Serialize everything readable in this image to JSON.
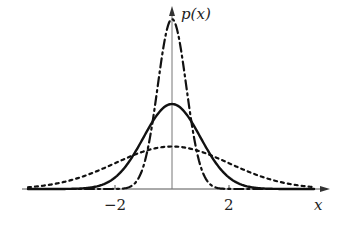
{
  "chart_data": {
    "type": "line",
    "title": "",
    "ylabel": "p(x)",
    "xlabel": "x",
    "x_ticks": [
      -2,
      2
    ],
    "x_tick_labels": [
      "−2",
      "2"
    ],
    "xlim": [
      -5,
      5
    ],
    "ylim": [
      0,
      0.8
    ],
    "grid": false,
    "legend": "none",
    "series": [
      {
        "name": "normal sigma=0.5",
        "style": "dash-dot",
        "mean": 0,
        "sigma": 0.5,
        "peak": 0.798
      },
      {
        "name": "normal sigma=1",
        "style": "solid",
        "mean": 0,
        "sigma": 1,
        "peak": 0.399
      },
      {
        "name": "normal sigma=2",
        "style": "dotted",
        "mean": 0,
        "sigma": 2,
        "peak": 0.199
      }
    ]
  },
  "labels": {
    "y_axis": "p(x)",
    "x_axis": "x",
    "tick_neg2": "−2",
    "tick_pos2": "2"
  },
  "layout": {
    "origin_x": 172,
    "axis_y": 189,
    "px_per_unit_x": 28.5,
    "px_per_unit_y": 213,
    "x_start": 28,
    "x_end": 314
  }
}
